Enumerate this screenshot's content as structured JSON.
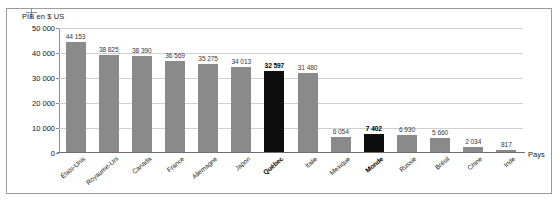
{
  "figure": {
    "y_axis_title": "PIB en $ US",
    "x_axis_title": "Pays",
    "highlight_color": "#0d0d0d",
    "bar_color": "#8a8a8a",
    "grid_color": "#d0d0d0"
  },
  "chart_data": {
    "type": "bar",
    "title": "PIB en $ US",
    "xlabel": "Pays",
    "ylabel": "PIB en $ US",
    "ylim": [
      0,
      50000
    ],
    "yticks": [
      0,
      10000,
      20000,
      30000,
      40000,
      50000
    ],
    "ytick_labels": [
      "0",
      "10 000",
      "20 000",
      "30 000",
      "40 000",
      "50 000"
    ],
    "grid": true,
    "legend": "none",
    "categories": [
      "États-Unis",
      "Royaume-Uni",
      "Canada",
      "France",
      "Allemagne",
      "Japon",
      "Québec",
      "Italie",
      "Mexique",
      "Monde",
      "Russie",
      "Brésil",
      "Chine",
      "Inde"
    ],
    "values": [
      44153,
      38825,
      38390,
      36569,
      35275,
      34013,
      32597,
      31480,
      6054,
      7402,
      6930,
      5660,
      2034,
      817
    ],
    "value_labels": [
      "44 153",
      "38 825",
      "38 390",
      "36 569",
      "35 275",
      "34 013",
      "32 597",
      "31 480",
      "6 054",
      "7 402",
      "6 930",
      "5 660",
      "2 034",
      "817"
    ],
    "highlighted": [
      false,
      false,
      false,
      false,
      false,
      false,
      true,
      false,
      false,
      true,
      false,
      false,
      false,
      false
    ]
  }
}
